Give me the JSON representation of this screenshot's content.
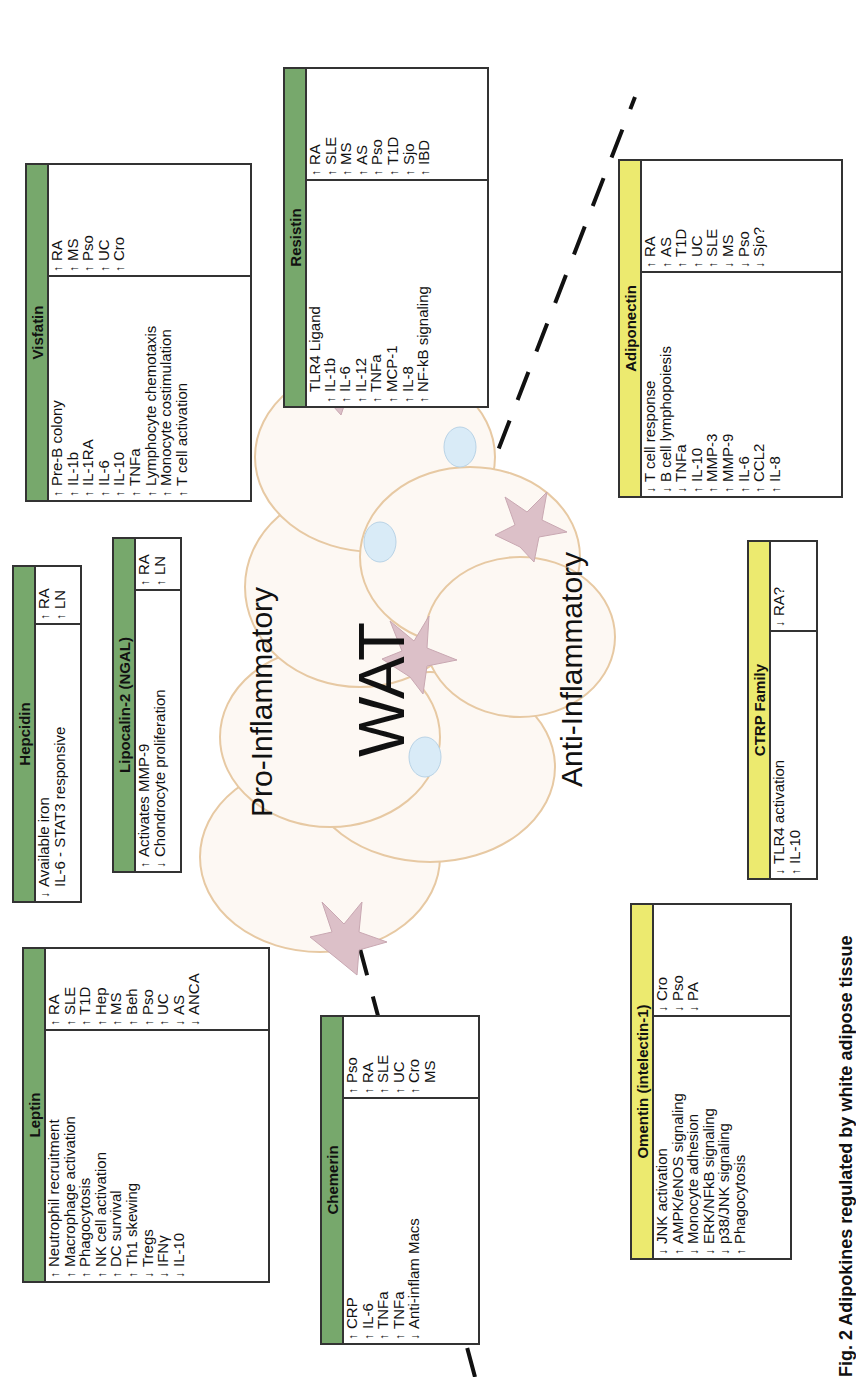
{
  "labels": {
    "pro": "Pro-Inflammatory",
    "anti": "Anti-Inflammatory",
    "center": "WAT",
    "caption": "Fig. 2 Adipokines regulated by white adipose tissue"
  },
  "colors": {
    "pro_header": "#77a86c",
    "anti_header": "#ecea6f",
    "adipocyte_fill": "#fdf8f3",
    "adipocyte_stroke": "#e7c9a3",
    "macrophage": "#dcc0c8",
    "lymphocyte": "#d9ebf7"
  },
  "boxes": {
    "leptin": {
      "title": "Leptin",
      "effects": [
        {
          "dir": "↑",
          "text": "Neutrophil recruitment"
        },
        {
          "dir": "↑",
          "text": "Macrophage activation"
        },
        {
          "dir": "↑",
          "text": "Phagocytosis"
        },
        {
          "dir": "↑",
          "text": "NK cell activation"
        },
        {
          "dir": "↑",
          "text": "DC survival"
        },
        {
          "dir": "↑",
          "text": "Th1 skewing"
        },
        {
          "dir": "↓",
          "text": "Tregs"
        },
        {
          "dir": "↓",
          "text": "IFNγ"
        },
        {
          "dir": "↓",
          "text": "IL-10"
        }
      ],
      "diseases": [
        {
          "dir": "↑",
          "text": "RA"
        },
        {
          "dir": "↑",
          "text": "SLE"
        },
        {
          "dir": "↑",
          "text": "T1D"
        },
        {
          "dir": "↑",
          "text": "Hep"
        },
        {
          "dir": "↑",
          "text": "MS"
        },
        {
          "dir": "↑",
          "text": "Beh"
        },
        {
          "dir": "↑",
          "text": "Pso"
        },
        {
          "dir": "↑",
          "text": "UC"
        },
        {
          "dir": "↓",
          "text": "AS"
        },
        {
          "dir": "↓",
          "text": "ANCA"
        }
      ]
    },
    "hepcidin": {
      "title": "Hepcidin",
      "effects": [
        {
          "dir": "↓",
          "text": "Available iron"
        },
        {
          "dir": "",
          "text": "IL-6 - STAT3 responsive"
        }
      ],
      "diseases": [
        {
          "dir": "↑",
          "text": "RA"
        },
        {
          "dir": "↑",
          "text": "LN"
        }
      ]
    },
    "lipocalin": {
      "title": "Lipocalin-2 (NGAL)",
      "effects": [
        {
          "dir": "↑",
          "text": "Activates MMP-9"
        },
        {
          "dir": "↓",
          "text": "Chondrocyte proliferation"
        }
      ],
      "diseases": [
        {
          "dir": "↑",
          "text": "RA"
        },
        {
          "dir": "↑",
          "text": "LN"
        }
      ]
    },
    "visfatin": {
      "title": "Visfatin",
      "effects": [
        {
          "dir": "↑",
          "text": "Pre-B colony"
        },
        {
          "dir": "↑",
          "text": "IL-1b"
        },
        {
          "dir": "↑",
          "text": "IL-1RA"
        },
        {
          "dir": "↑",
          "text": "IL-6"
        },
        {
          "dir": "↑",
          "text": "IL-10"
        },
        {
          "dir": "↑",
          "text": "TNFa"
        },
        {
          "dir": "↑",
          "text": "Lymphocyte chemotaxis"
        },
        {
          "dir": "↑",
          "text": "Monocyte costimulation"
        },
        {
          "dir": "↑",
          "text": "T cell activation"
        }
      ],
      "diseases": [
        {
          "dir": "↑",
          "text": "RA"
        },
        {
          "dir": "↑",
          "text": "MS"
        },
        {
          "dir": "↑",
          "text": "Pso"
        },
        {
          "dir": "↑",
          "text": "UC"
        },
        {
          "dir": "↑",
          "text": "Cro"
        }
      ]
    },
    "resistin": {
      "title": "Resistin",
      "effects": [
        {
          "dir": "",
          "text": "TLR4 Ligand"
        },
        {
          "dir": "↑",
          "text": "IL-1b"
        },
        {
          "dir": "↑",
          "text": "IL-6"
        },
        {
          "dir": "↑",
          "text": "IL-12"
        },
        {
          "dir": "↑",
          "text": "TNFa"
        },
        {
          "dir": "↑",
          "text": "MCP-1"
        },
        {
          "dir": "↑",
          "text": "IL-8"
        },
        {
          "dir": "↑",
          "text": "NF-kB signaling"
        }
      ],
      "diseases": [
        {
          "dir": "↑",
          "text": "RA"
        },
        {
          "dir": "↑",
          "text": "SLE"
        },
        {
          "dir": "↑",
          "text": "MS"
        },
        {
          "dir": "↑",
          "text": "AS"
        },
        {
          "dir": "↑",
          "text": "Pso"
        },
        {
          "dir": "↑",
          "text": "T1D"
        },
        {
          "dir": "↑",
          "text": "Sjo"
        },
        {
          "dir": "↑",
          "text": "IBD"
        }
      ]
    },
    "chemerin": {
      "title": "Chemerin",
      "effects": [
        {
          "dir": "↑",
          "text": "CRP"
        },
        {
          "dir": "↑",
          "text": "IL-6"
        },
        {
          "dir": "↑",
          "text": "TNFa"
        },
        {
          "dir": "↑",
          "text": "TNFa"
        },
        {
          "dir": "↓",
          "text": "Anti-inflam Macs"
        }
      ],
      "diseases": [
        {
          "dir": "↑",
          "text": "Pso"
        },
        {
          "dir": "↑",
          "text": "RA"
        },
        {
          "dir": "↑",
          "text": "SLE"
        },
        {
          "dir": "↑",
          "text": "UC"
        },
        {
          "dir": "↑",
          "text": "Cro"
        },
        {
          "dir": "",
          "text": "MS"
        }
      ]
    },
    "adiponectin": {
      "title": "Adiponectin",
      "effects": [
        {
          "dir": "↓",
          "text": "T cell response"
        },
        {
          "dir": "↓",
          "text": "B cell lymphopoiesis"
        },
        {
          "dir": "↓",
          "text": "TNFa"
        },
        {
          "dir": "↑",
          "text": "IL-10"
        },
        {
          "dir": "↑",
          "text": "MMP-3"
        },
        {
          "dir": "↑",
          "text": "MMP-9"
        },
        {
          "dir": "↑",
          "text": "IL-6"
        },
        {
          "dir": "↑",
          "text": "CCL2"
        },
        {
          "dir": "↑",
          "text": "IL-8"
        }
      ],
      "diseases": [
        {
          "dir": "↑",
          "text": "RA"
        },
        {
          "dir": "↑",
          "text": "AS"
        },
        {
          "dir": "↑",
          "text": "T1D"
        },
        {
          "dir": "↑",
          "text": "UC"
        },
        {
          "dir": "↑",
          "text": "SLE"
        },
        {
          "dir": "↓",
          "text": "MS"
        },
        {
          "dir": "↓",
          "text": "Pso"
        },
        {
          "dir": "↓",
          "text": "Sjo?"
        }
      ]
    },
    "ctrp": {
      "title": "CTRP Family",
      "effects": [
        {
          "dir": "↓",
          "text": "TLR4 activation"
        },
        {
          "dir": "↑",
          "text": "IL-10"
        }
      ],
      "diseases": [
        {
          "dir": "↓",
          "text": "RA?"
        }
      ]
    },
    "omentin": {
      "title": "Omentin (intelectin-1)",
      "effects": [
        {
          "dir": "↓",
          "text": "JNK activation"
        },
        {
          "dir": "↑",
          "text": "AMPK/eNOS signaling"
        },
        {
          "dir": "↓",
          "text": "Monocyte adhesion"
        },
        {
          "dir": "↓",
          "text": "ERK/NFkB signaling"
        },
        {
          "dir": "↓",
          "text": "p38/JNK signaling"
        },
        {
          "dir": "↑",
          "text": "Phagocytosis"
        }
      ],
      "diseases": [
        {
          "dir": "↓",
          "text": "Cro"
        },
        {
          "dir": "↓",
          "text": "Pso"
        },
        {
          "dir": "↓",
          "text": "PA"
        }
      ]
    }
  }
}
